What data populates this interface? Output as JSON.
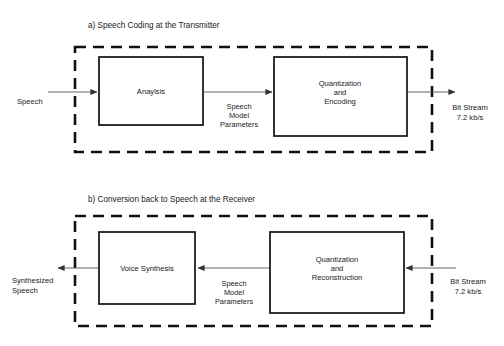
{
  "figure": {
    "background_color": "#ffffff",
    "line_color": "#111111",
    "connector_color": "#555555"
  },
  "panels": [
    {
      "id": "transmitter",
      "title": "a) Speech Coding at the Transmitter",
      "input_label_line1": "Speech",
      "input_label_line2": "",
      "output_label_line1": "Bit Stream",
      "output_label_line2": "7.2 kb/s",
      "blocks": [
        {
          "id": "analysis",
          "label_line1": "Anaylsis",
          "label_line2": "",
          "label_line3": ""
        },
        {
          "id": "quantization-encoding",
          "label_line1": "Quantization",
          "label_line2": "and",
          "label_line3": "Encoding"
        }
      ],
      "edge_label_line1": "Speech",
      "edge_label_line2": "Model",
      "edge_label_line3": "Parameters",
      "flow_direction": "left-to-right"
    },
    {
      "id": "receiver",
      "title": "b) Conversion back to Speech at the Receiver",
      "input_label_line1": "Bit Stream",
      "input_label_line2": "7.2 kb/s",
      "output_label_line1": "Synthesized",
      "output_label_line2": "Speech",
      "blocks": [
        {
          "id": "voice-synthesis",
          "label_line1": "Voice Synthesis",
          "label_line2": "",
          "label_line3": ""
        },
        {
          "id": "quantization-reconstruction",
          "label_line1": "Quantization",
          "label_line2": "and",
          "label_line3": "Reconstruction"
        }
      ],
      "edge_label_line1": "Speech",
      "edge_label_line2": "Model",
      "edge_label_line3": "Parameters",
      "flow_direction": "right-to-left"
    }
  ]
}
